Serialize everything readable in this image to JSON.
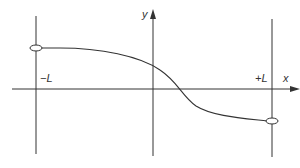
{
  "diagram": {
    "x_axis_label": "x",
    "y_axis_label": "y",
    "left_boundary_label": "−L",
    "right_boundary_label": "+L",
    "curve": {
      "description": "smooth decreasing curve from a positive value at x=-L to a negative value at x=+L, crossing zero slightly right of the y-axis",
      "left_endpoint": "open-circle",
      "right_endpoint": "open-circle"
    }
  }
}
